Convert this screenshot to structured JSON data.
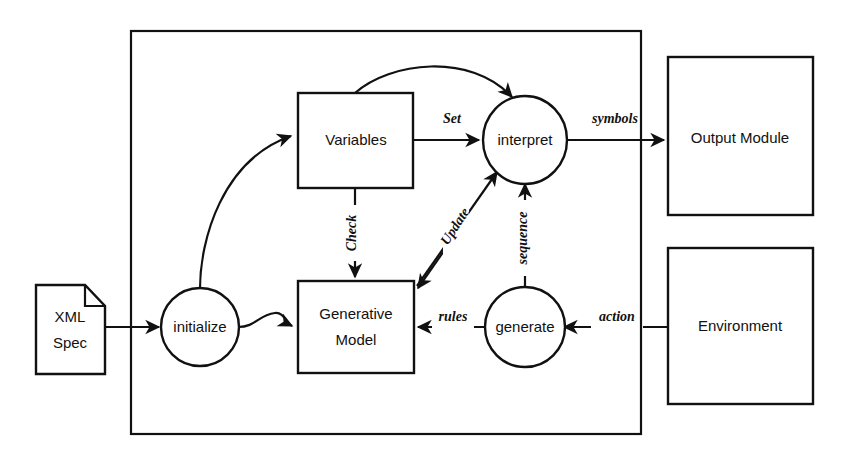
{
  "diagram": {
    "background_color": "#ffffff",
    "line_color": "#111111",
    "nodes": {
      "xml_spec": {
        "label_line1": "XML",
        "label_line2": "Spec",
        "shape": "document"
      },
      "initialize": {
        "label": "initialize",
        "shape": "circle"
      },
      "variables": {
        "label": "Variables",
        "shape": "rectangle"
      },
      "generative_model": {
        "label_line1": "Generative",
        "label_line2": "Model",
        "shape": "rectangle"
      },
      "interpret": {
        "label": "interpret",
        "shape": "circle"
      },
      "generate": {
        "label": "generate",
        "shape": "circle"
      },
      "output_module": {
        "label": "Output Module",
        "shape": "rectangle"
      },
      "environment": {
        "label": "Environment",
        "shape": "rectangle"
      }
    },
    "edge_labels": {
      "set": "Set",
      "check": "Check",
      "update": "Update",
      "sequence": "sequence",
      "symbols": "symbols",
      "rules": "rules",
      "action": "action"
    },
    "system_boundary": {
      "label": ""
    }
  }
}
